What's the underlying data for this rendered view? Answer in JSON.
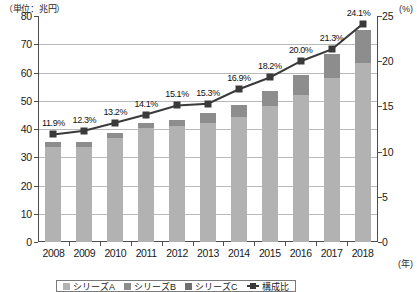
{
  "chart_data": {
    "type": "bar",
    "title": "",
    "subtitle": "",
    "unit_left": "（単位：兆円）",
    "unit_right": "(%)",
    "unit_x": "(年)",
    "xlabel": "",
    "ylabel": "",
    "grid": true,
    "legend_position": "bottom",
    "categories": [
      "2008",
      "2009",
      "2010",
      "2011",
      "2012",
      "2013",
      "2014",
      "2015",
      "2016",
      "2017",
      "2018"
    ],
    "ylim": [
      0,
      80
    ],
    "yticks": [
      "0",
      "10",
      "20",
      "30",
      "40",
      "50",
      "60",
      "70",
      "80"
    ],
    "y2lim": [
      0,
      25
    ],
    "y2ticks": [
      "0",
      "5",
      "10",
      "15",
      "20",
      "25"
    ],
    "series": [
      {
        "name": "シリーズA",
        "type": "bar-segment",
        "color": "#b2b2b2",
        "values": [
          33.5,
          33.6,
          36.8,
          40.2,
          41.0,
          42.3,
          44.1,
          48.0,
          52.0,
          58.0,
          63.5
        ]
      },
      {
        "name": "シリーズB",
        "type": "bar-segment",
        "color": "#8d8d8d",
        "values": [
          1.8,
          1.8,
          1.7,
          1.9,
          2.3,
          3.2,
          4.4,
          5.6,
          7.0,
          8.5,
          11.5
        ]
      }
    ],
    "bar_totals": [
      35.3,
      35.4,
      38.5,
      42.1,
      43.3,
      45.5,
      48.5,
      53.6,
      59.0,
      66.5,
      75.0
    ],
    "line_series": {
      "name": "構成比",
      "color": "#3a3a3a",
      "axis": "right",
      "values": [
        11.9,
        12.3,
        13.2,
        14.1,
        15.1,
        15.3,
        16.9,
        18.2,
        20.0,
        21.3,
        24.1
      ],
      "labels": [
        "11.9%",
        "12.3%",
        "13.2%",
        "14.1%",
        "15.1%",
        "15.3%",
        "16.9%",
        "18.2%",
        "20.0%",
        "21.3%",
        "24.1%"
      ]
    },
    "legend_entries": [
      {
        "label": "シリーズA",
        "swatch": "sw-a",
        "kind": "box"
      },
      {
        "label": "シリーズB",
        "swatch": "sw-b",
        "kind": "box"
      },
      {
        "label": "シリーズC",
        "swatch": "sw-c",
        "kind": "box"
      },
      {
        "label": "構成比",
        "swatch": "sw-line",
        "kind": "line"
      }
    ]
  }
}
